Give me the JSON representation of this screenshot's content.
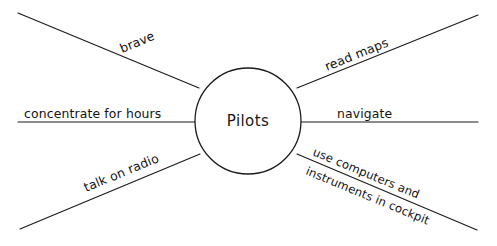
{
  "diagram": {
    "type": "mind-map",
    "title_node": {
      "label": "Pilots",
      "shape": "circle",
      "center_x": 248,
      "center_y": 121,
      "radius": 53
    },
    "canvas": {
      "width": 497,
      "height": 246,
      "background_color": "#ffffff",
      "stroke_color": "#1b1b1b"
    },
    "branches": [
      {
        "id": "brave",
        "label": "brave",
        "position": "upper-left",
        "label_rotation": -22,
        "line": {
          "x1": 18,
          "y1": 13,
          "x2": 199,
          "y2": 88
        }
      },
      {
        "id": "concentrate-for-hours",
        "label": "concentrate for hours",
        "position": "left",
        "label_rotation": 0,
        "line": {
          "x1": 18,
          "y1": 122,
          "x2": 195,
          "y2": 122
        }
      },
      {
        "id": "talk-on-radio",
        "label": "talk on radio",
        "position": "lower-left",
        "label_rotation": 22,
        "line": {
          "x1": 20,
          "y1": 229,
          "x2": 200,
          "y2": 154
        }
      },
      {
        "id": "read-maps",
        "label": "read maps",
        "position": "upper-right",
        "label_rotation": -22,
        "line": {
          "x1": 297,
          "y1": 88,
          "x2": 478,
          "y2": 15
        }
      },
      {
        "id": "navigate",
        "label": "navigate",
        "position": "right",
        "label_rotation": 0,
        "line": {
          "x1": 301,
          "y1": 122,
          "x2": 478,
          "y2": 122
        }
      },
      {
        "id": "use-computers-and-instruments-in-cockpit",
        "label_line_1": "use computers and",
        "label_line_2": "instruments in cockpit",
        "position": "lower-right",
        "label_rotation": 22,
        "line": {
          "x1": 297,
          "y1": 154,
          "x2": 477,
          "y2": 230
        }
      }
    ]
  }
}
